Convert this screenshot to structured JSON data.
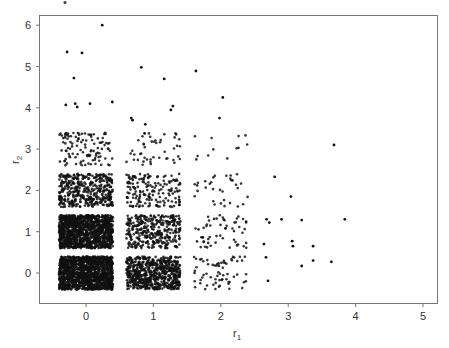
{
  "chart_data": {
    "type": "scatter",
    "title": "",
    "xlabel": "r1",
    "ylabel": "r2",
    "xlabel_main": "r",
    "xlabel_sub": "1",
    "ylabel_main": "r",
    "ylabel_sub": "2",
    "xlim": [
      -0.7,
      5.2
    ],
    "ylim": [
      -0.55,
      6.25
    ],
    "xticks": [
      0,
      1,
      2,
      3,
      4,
      5
    ],
    "yticks": [
      0,
      1,
      2,
      3,
      4,
      5,
      6
    ],
    "grid": false,
    "legend": null,
    "jitter": 0.4,
    "point_color": "#111111",
    "clusters": [
      {
        "x": 0,
        "y": 0,
        "count": 1400
      },
      {
        "x": 0,
        "y": 1,
        "count": 1200
      },
      {
        "x": 0,
        "y": 2,
        "count": 420
      },
      {
        "x": 0,
        "y": 3,
        "count": 110
      },
      {
        "x": 1,
        "y": 0,
        "count": 650
      },
      {
        "x": 1,
        "y": 1,
        "count": 340
      },
      {
        "x": 1,
        "y": 2,
        "count": 170
      },
      {
        "x": 1,
        "y": 3,
        "count": 45
      },
      {
        "x": 2,
        "y": 0,
        "count": 65
      },
      {
        "x": 2,
        "y": 1,
        "count": 55
      },
      {
        "x": 2,
        "y": 2,
        "count": 32
      },
      {
        "x": 2,
        "y": 3,
        "count": 12
      }
    ],
    "points": [
      {
        "x": 0.24,
        "y": 6.0
      },
      {
        "x": -0.28,
        "y": 5.35
      },
      {
        "x": -0.06,
        "y": 5.33
      },
      {
        "x": -0.18,
        "y": 4.72
      },
      {
        "x": -0.3,
        "y": 4.07
      },
      {
        "x": -0.16,
        "y": 4.1
      },
      {
        "x": -0.13,
        "y": 4.02
      },
      {
        "x": 0.06,
        "y": 4.1
      },
      {
        "x": 0.39,
        "y": 4.14
      },
      {
        "x": 0.82,
        "y": 4.98
      },
      {
        "x": 1.16,
        "y": 4.7
      },
      {
        "x": 1.63,
        "y": 4.89
      },
      {
        "x": 1.29,
        "y": 4.04
      },
      {
        "x": 1.26,
        "y": 3.95
      },
      {
        "x": 0.67,
        "y": 3.75
      },
      {
        "x": 0.69,
        "y": 3.7
      },
      {
        "x": 0.88,
        "y": 3.6
      },
      {
        "x": 0.87,
        "y": 3.38
      },
      {
        "x": 2.03,
        "y": 4.25
      },
      {
        "x": 1.98,
        "y": 3.75
      },
      {
        "x": 3.68,
        "y": 3.1
      },
      {
        "x": 2.8,
        "y": 2.33
      },
      {
        "x": 3.04,
        "y": 1.85
      },
      {
        "x": 2.68,
        "y": 1.3
      },
      {
        "x": 2.72,
        "y": 1.22
      },
      {
        "x": 2.9,
        "y": 1.3
      },
      {
        "x": 3.2,
        "y": 1.28
      },
      {
        "x": 3.84,
        "y": 1.3
      },
      {
        "x": 2.64,
        "y": 0.7
      },
      {
        "x": 3.06,
        "y": 0.77
      },
      {
        "x": 3.07,
        "y": 0.65
      },
      {
        "x": 3.37,
        "y": 0.65
      },
      {
        "x": 2.67,
        "y": 0.38
      },
      {
        "x": 3.2,
        "y": 0.17
      },
      {
        "x": 3.37,
        "y": 0.3
      },
      {
        "x": 3.64,
        "y": 0.27
      },
      {
        "x": 2.7,
        "y": -0.19
      }
    ]
  },
  "header": {
    "stray_mark": "•"
  }
}
